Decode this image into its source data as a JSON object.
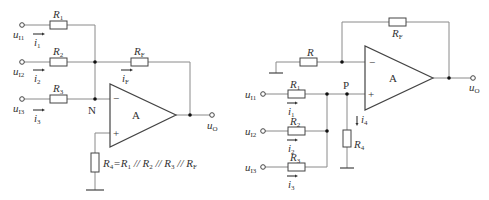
{
  "left_circuit": {
    "title": "Inverting summing amplifier",
    "inputs": [
      {
        "voltage": "u",
        "voltage_sub": "I1",
        "current": "i",
        "current_sub": "1",
        "resistor": "R",
        "resistor_sub": "1"
      },
      {
        "voltage": "u",
        "voltage_sub": "I2",
        "current": "i",
        "current_sub": "2",
        "resistor": "R",
        "resistor_sub": "2"
      },
      {
        "voltage": "u",
        "voltage_sub": "I3",
        "current": "i",
        "current_sub": "3",
        "resistor": "R",
        "resistor_sub": "3"
      }
    ],
    "feedback": {
      "resistor": "R",
      "resistor_sub": "F",
      "current": "i",
      "current_sub": "F"
    },
    "node_label": "N",
    "opamp_label": "A",
    "minus_sign": "−",
    "plus_sign": "+",
    "output": {
      "voltage": "u",
      "voltage_sub": "O"
    },
    "r4_formula": {
      "parts": [
        "R",
        "4",
        "=R",
        "1",
        " // R",
        "2",
        " // R",
        "3",
        " // R",
        "F"
      ]
    }
  },
  "right_circuit": {
    "title": "Non-inverting summing amplifier",
    "ground_resistor": {
      "resistor": "R"
    },
    "feedback": {
      "resistor": "R",
      "resistor_sub": "F"
    },
    "inputs": [
      {
        "voltage": "u",
        "voltage_sub": "I1",
        "current": "i",
        "current_sub": "1",
        "resistor": "R",
        "resistor_sub": "1"
      },
      {
        "voltage": "u",
        "voltage_sub": "I2",
        "current": "i",
        "current_sub": "2",
        "resistor": "R",
        "resistor_sub": "2"
      },
      {
        "voltage": "u",
        "voltage_sub": "I3",
        "current": "i",
        "current_sub": "3",
        "resistor": "R",
        "resistor_sub": "3"
      }
    ],
    "node_label": "P",
    "opamp_label": "A",
    "minus_sign": "−",
    "plus_sign": "+",
    "r4": {
      "resistor": "R",
      "resistor_sub": "4",
      "current": "i",
      "current_sub": "4"
    },
    "output": {
      "voltage": "u",
      "voltage_sub": "O"
    }
  }
}
